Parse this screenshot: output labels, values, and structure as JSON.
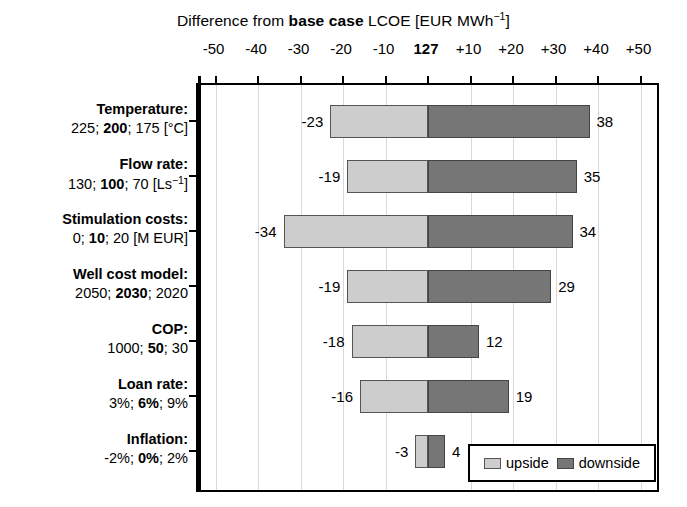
{
  "chart_data": {
    "type": "bar",
    "subtype": "tornado",
    "title": "Difference from base case LCOE [EUR MWh−1]",
    "title_parts": {
      "prefix": "Difference from ",
      "bold": "base case",
      "suffix": " LCOE [EUR MWh",
      "superscript": "−1",
      "tail": "]"
    },
    "xlabel": "",
    "ylabel": "",
    "xlim": [
      -55,
      55
    ],
    "xticks": [
      -50,
      -40,
      -30,
      -20,
      -10,
      0,
      10,
      20,
      30,
      40,
      50
    ],
    "xtick_labels": [
      "-50",
      "-40",
      "-30",
      "-20",
      "-10",
      "127",
      "+10",
      "+20",
      "+30",
      "+40",
      "+50"
    ],
    "base_case_value": 127,
    "base_case_tick_index": 5,
    "grid": true,
    "grid_axis": "x",
    "legend_position": "bottom-right",
    "categories": [
      "Temperature:",
      "Flow rate:",
      "Stimulation costs:",
      "Well cost model:",
      "COP:",
      "Loan rate:",
      "Inflation:"
    ],
    "category_sublabels": [
      "225; 200; 175 [°C]",
      "130; 100; 70 [Ls−1]",
      "0; 10; 20 [M EUR]",
      "2050; 2030; 2020",
      "1000; 50; 30",
      "3%; 6%; 9%",
      "-2%; 0%; 2%"
    ],
    "series": [
      {
        "name": "upside",
        "color": "#cdcdcd",
        "values": [
          -23,
          -19,
          -34,
          -19,
          -18,
          -16,
          -3
        ]
      },
      {
        "name": "downside",
        "color": "#767676",
        "values": [
          38,
          35,
          34,
          29,
          12,
          19,
          4
        ]
      }
    ],
    "rows": [
      {
        "label": "Temperature:",
        "sublabel_parts": [
          {
            "text": "225; ",
            "bold": false
          },
          {
            "text": "200",
            "bold": true
          },
          {
            "text": "; 175 [°C]",
            "bold": false
          }
        ],
        "upside": -23,
        "downside": 38,
        "upside_label": "-23",
        "downside_label": "38"
      },
      {
        "label": "Flow rate:",
        "sublabel_parts": [
          {
            "text": "130; ",
            "bold": false
          },
          {
            "text": "100",
            "bold": true
          },
          {
            "text": "; 70 [Ls",
            "bold": false
          },
          {
            "text": "−1",
            "bold": false,
            "sup": true
          },
          {
            "text": "]",
            "bold": false
          }
        ],
        "upside": -19,
        "downside": 35,
        "upside_label": "-19",
        "downside_label": "35"
      },
      {
        "label": "Stimulation costs:",
        "sublabel_parts": [
          {
            "text": "0; ",
            "bold": false
          },
          {
            "text": "10",
            "bold": true
          },
          {
            "text": "; 20 [M EUR]",
            "bold": false
          }
        ],
        "upside": -34,
        "downside": 34,
        "upside_label": "-34",
        "downside_label": "34"
      },
      {
        "label": "Well cost model:",
        "sublabel_parts": [
          {
            "text": "2050; ",
            "bold": false
          },
          {
            "text": "2030",
            "bold": true
          },
          {
            "text": "; 2020",
            "bold": false
          }
        ],
        "upside": -19,
        "downside": 29,
        "upside_label": "-19",
        "downside_label": "29"
      },
      {
        "label": "COP:",
        "sublabel_parts": [
          {
            "text": "1000; ",
            "bold": false
          },
          {
            "text": "50",
            "bold": true
          },
          {
            "text": "; 30",
            "bold": false
          }
        ],
        "upside": -18,
        "downside": 12,
        "upside_label": "-18",
        "downside_label": "12"
      },
      {
        "label": "Loan rate:",
        "sublabel_parts": [
          {
            "text": "3%; ",
            "bold": false
          },
          {
            "text": "6%",
            "bold": true
          },
          {
            "text": "; 9%",
            "bold": false
          }
        ],
        "upside": -16,
        "downside": 19,
        "upside_label": "-16",
        "downside_label": "19"
      },
      {
        "label": "Inflation:",
        "sublabel_parts": [
          {
            "text": "-2%; ",
            "bold": false
          },
          {
            "text": "0%",
            "bold": true
          },
          {
            "text": "; 2%",
            "bold": false
          }
        ],
        "upside": -3,
        "downside": 4,
        "upside_label": "-3",
        "downside_label": "4"
      }
    ],
    "legend": [
      {
        "label": "upside",
        "color": "#cdcdcd"
      },
      {
        "label": "downside",
        "color": "#767676"
      }
    ]
  }
}
